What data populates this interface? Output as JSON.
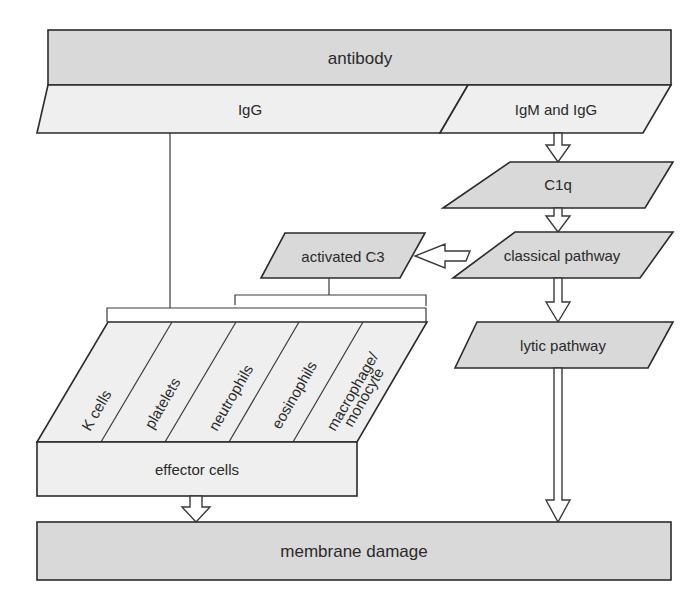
{
  "diagram": {
    "title_node": {
      "label": "antibody"
    },
    "antibody_classes": [
      {
        "label": "IgG"
      },
      {
        "label": "IgM and IgG"
      }
    ],
    "complement": {
      "c1q": {
        "label": "C1q"
      },
      "classical_pathway": {
        "label": "classical pathway"
      },
      "activated_c3": {
        "label": "activated C3"
      },
      "lytic_pathway": {
        "label": "lytic pathway"
      }
    },
    "effector_cell_types": [
      {
        "label": "K cells"
      },
      {
        "label": "platelets"
      },
      {
        "label": "neutrophils"
      },
      {
        "label": "eosinophils"
      },
      {
        "label_line1": "macrophage/",
        "label_line2": "monocyte"
      }
    ],
    "effector_cells": {
      "label": "effector cells"
    },
    "outcome": {
      "label": "membrane damage"
    },
    "colors": {
      "dark_fill": "#d9d9d9",
      "light_fill": "#efefef",
      "stroke": "#2b2b2b"
    }
  }
}
